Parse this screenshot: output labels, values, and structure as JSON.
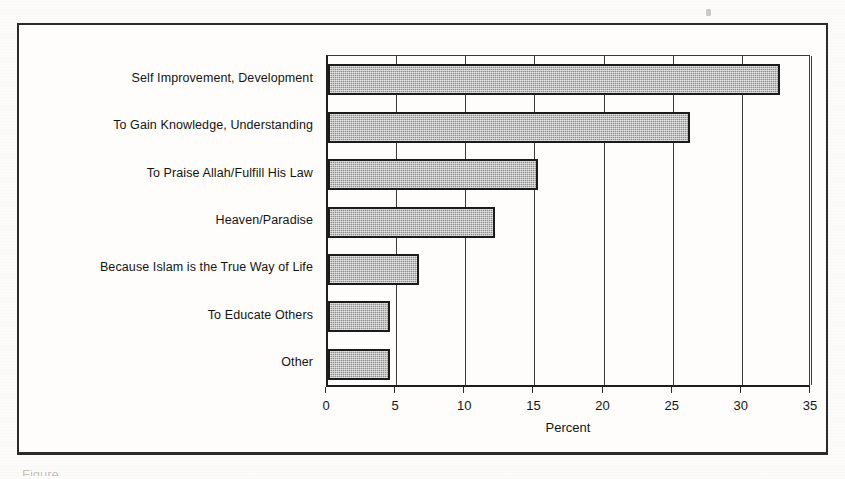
{
  "figure": {
    "background_color": "#fcfbf9",
    "frame_color": "#2b2b2b",
    "caption_partial": "Figure"
  },
  "chart_data": {
    "type": "bar",
    "orientation": "horizontal",
    "title": "",
    "subtitle": "",
    "xlabel": "Percent",
    "ylabel": "",
    "xlim": [
      0,
      35
    ],
    "xticks": [
      0,
      5,
      10,
      15,
      20,
      25,
      30,
      35
    ],
    "xtick_labels": [
      "0",
      "5",
      "10",
      "15",
      "20",
      "25",
      "30",
      "35"
    ],
    "grid": true,
    "grid_axis": "x",
    "legend": false,
    "legend_position": "none",
    "bar_fill_color": "#8d8d8d",
    "bar_edge_color": "#1b1b1b",
    "categories": [
      "Self Improvement, Development",
      "To Gain Knowledge, Understanding",
      "To Praise Allah/Fulfill His Law",
      "Heaven/Paradise",
      "Because Islam is the True Way of Life",
      "To Educate Others",
      "Other"
    ],
    "values": [
      32.7,
      26.2,
      15.2,
      12.1,
      6.6,
      4.5,
      4.5
    ],
    "series": [
      {
        "name": "Percent",
        "values": [
          32.7,
          26.2,
          15.2,
          12.1,
          6.6,
          4.5,
          4.5
        ]
      }
    ]
  }
}
